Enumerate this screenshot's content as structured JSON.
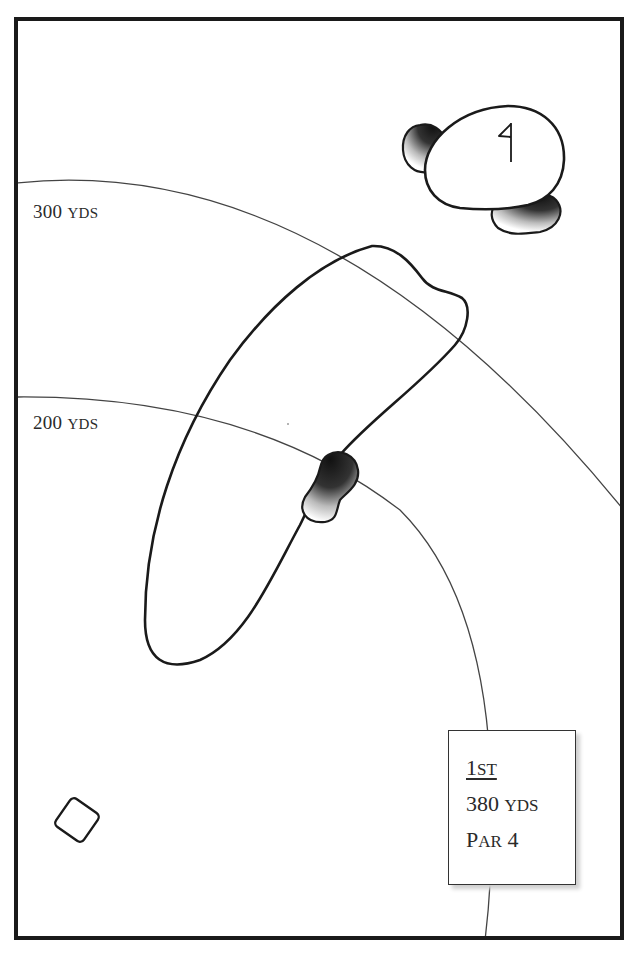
{
  "hole": {
    "number": "1",
    "number_suffix": "ST",
    "distance_value": "380",
    "distance_unit": "YDS",
    "par_label_first": "P",
    "par_label_rest": "AR",
    "par_value": "4"
  },
  "yardage_markers": [
    {
      "value": "300",
      "unit": "YDS"
    },
    {
      "value": "200",
      "unit": "YDS"
    }
  ],
  "features": {
    "green": "green-with-flag",
    "bunkers": [
      "greenside-bunker-left",
      "greenside-bunker-right",
      "fairway-bunker"
    ],
    "fairway": "dogleg-right-fairway",
    "tee": "tee-box"
  },
  "colors": {
    "frame": "#1a1a1a",
    "outline": "#1a1a1a",
    "arc": "#444444",
    "text": "#2a2a2a",
    "background": "#ffffff"
  }
}
